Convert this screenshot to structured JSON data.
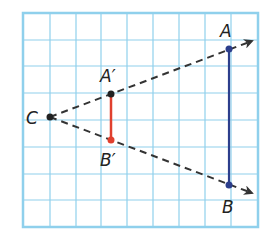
{
  "diagram": {
    "type": "dilation",
    "grid": {
      "left": 23,
      "top": 13,
      "right": 258,
      "bottom": 227,
      "columns": 9,
      "rows": 8,
      "color": "#8fd0ec"
    },
    "center": {
      "label": "C",
      "x": 50,
      "y": 117
    },
    "original_segment": {
      "color": "#2c3e8c",
      "points": [
        {
          "label": "A",
          "x": 229,
          "y": 49
        },
        {
          "label": "B",
          "x": 229,
          "y": 185
        }
      ]
    },
    "image_segment": {
      "color": "#e0402e",
      "points": [
        {
          "label": "A′",
          "x": 111,
          "y": 94
        },
        {
          "label": "B′",
          "x": 111,
          "y": 140
        }
      ]
    },
    "rays": {
      "style": "dashed",
      "color": "#333333"
    }
  },
  "labels": {
    "C": "C",
    "A": "A",
    "B": "B",
    "A_prime": "A′",
    "B_prime": "B′"
  }
}
